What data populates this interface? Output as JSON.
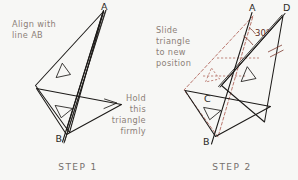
{
  "page": {
    "background_color": "#f7f7f5",
    "width": 298,
    "height": 180
  },
  "colors": {
    "annotation_text": "#8c7f78",
    "step_label": "#75706c",
    "ink": "#1c1a18",
    "triangle_fill": "#cdc4bd",
    "ghost_red": "#a8564a",
    "angle_text": "#5d2a22"
  },
  "panels": [
    {
      "id": "step1",
      "step_label": "STEP  1",
      "annotations": [
        {
          "name": "align-instruction",
          "lines": [
            "Align  with",
            "line  AB"
          ],
          "align": "left"
        },
        {
          "name": "hold-instruction",
          "lines": [
            "Hold",
            "this",
            "triangle",
            "firmly"
          ],
          "align": "right"
        }
      ],
      "vertex_labels": [
        {
          "name": "point-a",
          "text": "A"
        },
        {
          "name": "point-b",
          "text": "B"
        }
      ]
    },
    {
      "id": "step2",
      "step_label": "STEP  2",
      "annotations": [
        {
          "name": "slide-instruction",
          "lines": [
            "Slide",
            "triangle",
            "to  new",
            "position"
          ],
          "align": "left"
        }
      ],
      "vertex_labels": [
        {
          "name": "point-a",
          "text": "A"
        },
        {
          "name": "point-b",
          "text": "B"
        },
        {
          "name": "point-c",
          "text": "C"
        },
        {
          "name": "point-d",
          "text": "D"
        }
      ],
      "angle_label": "30°"
    }
  ],
  "step1": {
    "align_line_1": "Align  with",
    "align_line_2": "line  AB",
    "hold_line_1": "Hold",
    "hold_line_2": "this",
    "hold_line_3": "triangle",
    "hold_line_4": "firmly",
    "label_a": "A",
    "label_b": "B",
    "step": "STEP  1"
  },
  "step2": {
    "slide_line_1": "Slide",
    "slide_line_2": "triangle",
    "slide_line_3": "to  new",
    "slide_line_4": "position",
    "label_a": "A",
    "label_b": "B",
    "label_c": "C",
    "label_d": "D",
    "angle": "30°",
    "step": "STEP  2"
  }
}
